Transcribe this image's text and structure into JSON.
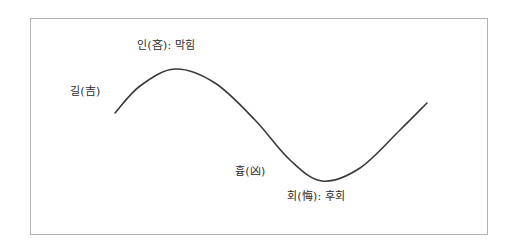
{
  "figure": {
    "background_color": "#ffffff",
    "frame": {
      "border_color": "#b2b2b2",
      "fill_color": "#ffffff"
    },
    "curve": {
      "stroke_color": "#3a3a3a",
      "stroke_width": 1.6
    }
  },
  "labels": {
    "gil": "길(吉)",
    "in": "인(吝): 막힘",
    "hyung": "흉(凶)",
    "hoe": "회(悔): 후회"
  },
  "chart_data": {
    "type": "line",
    "title": "",
    "xlabel": "",
    "ylabel": "",
    "grid": false,
    "legend": "none",
    "axis_visible": false,
    "x": [
      115,
      140,
      175,
      215,
      255,
      290,
      322,
      360,
      400,
      427
    ],
    "y": [
      113,
      86,
      69,
      83,
      120,
      160,
      181,
      168,
      130,
      103
    ],
    "annotations": [
      {
        "name": "gil",
        "text": "길(吉)",
        "x": 70,
        "y": 85,
        "marks": "rising-start"
      },
      {
        "name": "in",
        "text": "인(吝): 막힘",
        "x": 137,
        "y": 39,
        "marks": "crest"
      },
      {
        "name": "hyung",
        "text": "흉(凶)",
        "x": 235,
        "y": 165,
        "marks": "descent"
      },
      {
        "name": "hoe",
        "text": "회(悔): 후회",
        "x": 287,
        "y": 190,
        "marks": "trough"
      }
    ]
  }
}
